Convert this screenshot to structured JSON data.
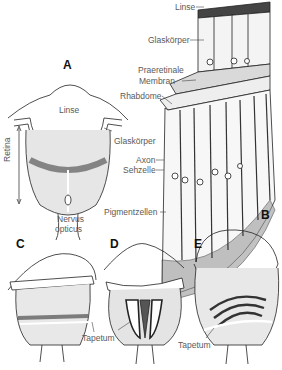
{
  "figure": {
    "panels": [
      {
        "id": "A",
        "letter": "A",
        "labels": {
          "lens": "Linse",
          "vitreous": "Glaskörper",
          "retina": "Retina",
          "nerve_line1": "Nervus",
          "nerve_line2": "opticus"
        }
      },
      {
        "id": "B",
        "letter": "B",
        "labels": {
          "lens": "Linse",
          "vitreous": "Glaskörper",
          "preretinal_line1": "Praeretinale",
          "preretinal_line2": "Membran",
          "rhabdome": "Rhabdome",
          "axon": "Axon",
          "sensory_cell": "Sehzelle",
          "pigment_cells": "Pigmentzellen"
        }
      },
      {
        "id": "C",
        "letter": "C",
        "labels": {
          "tapetum": "Tapetum"
        }
      },
      {
        "id": "D",
        "letter": "D",
        "labels": {
          "tapetum": "Tapetum"
        }
      },
      {
        "id": "E",
        "letter": "E",
        "labels": {
          "tapetum": "Tapetum"
        }
      }
    ]
  },
  "colors": {
    "line": "#222222",
    "label": "#5a5a5a",
    "shade": "#cfcfcf",
    "dark": "#3a3a3a"
  }
}
